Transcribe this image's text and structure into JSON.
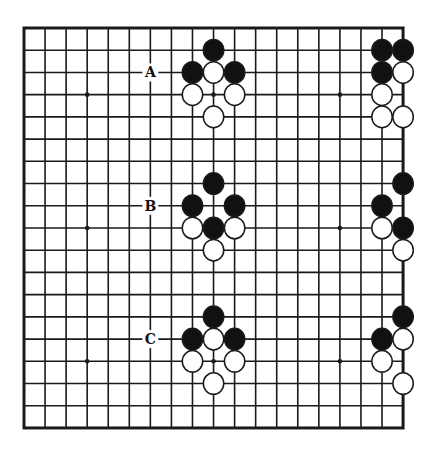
{
  "diagram": {
    "type": "go-board",
    "size": 19,
    "colors": {
      "background": "#ffffff",
      "line": "#1a1a1a",
      "black_stone": "#111111",
      "white_stone": "#ffffff",
      "stone_outline": "#1a1a1a"
    },
    "geometry": {
      "origin_x": 24,
      "origin_y": 28,
      "step_x": 21.06,
      "step_y": 22.22
    },
    "star_points": [
      [
        3,
        3
      ],
      [
        9,
        3
      ],
      [
        15,
        3
      ],
      [
        3,
        9
      ],
      [
        9,
        9
      ],
      [
        15,
        9
      ],
      [
        3,
        15
      ],
      [
        9,
        15
      ],
      [
        15,
        15
      ]
    ],
    "labels": [
      {
        "text": "A",
        "col": 6,
        "row": 2
      },
      {
        "text": "B",
        "col": 6,
        "row": 8
      },
      {
        "text": "C",
        "col": 6,
        "row": 14
      }
    ],
    "stones": [
      {
        "color": "black",
        "col": 9,
        "row": 1
      },
      {
        "color": "black",
        "col": 8,
        "row": 2
      },
      {
        "color": "white",
        "col": 9,
        "row": 2
      },
      {
        "color": "black",
        "col": 10,
        "row": 2
      },
      {
        "color": "white",
        "col": 8,
        "row": 3
      },
      {
        "color": "white",
        "col": 10,
        "row": 3
      },
      {
        "color": "white",
        "col": 9,
        "row": 4
      },
      {
        "color": "black",
        "col": 17,
        "row": 1
      },
      {
        "color": "black",
        "col": 18,
        "row": 1
      },
      {
        "color": "black",
        "col": 17,
        "row": 2
      },
      {
        "color": "white",
        "col": 18,
        "row": 2
      },
      {
        "color": "white",
        "col": 17,
        "row": 3
      },
      {
        "color": "white",
        "col": 17,
        "row": 4
      },
      {
        "color": "white",
        "col": 18,
        "row": 4
      },
      {
        "color": "black",
        "col": 9,
        "row": 7
      },
      {
        "color": "black",
        "col": 8,
        "row": 8
      },
      {
        "color": "black",
        "col": 10,
        "row": 8
      },
      {
        "color": "white",
        "col": 8,
        "row": 9
      },
      {
        "color": "black",
        "col": 9,
        "row": 9
      },
      {
        "color": "white",
        "col": 10,
        "row": 9
      },
      {
        "color": "white",
        "col": 9,
        "row": 10
      },
      {
        "color": "black",
        "col": 18,
        "row": 7
      },
      {
        "color": "black",
        "col": 17,
        "row": 8
      },
      {
        "color": "white",
        "col": 17,
        "row": 9
      },
      {
        "color": "black",
        "col": 18,
        "row": 9
      },
      {
        "color": "white",
        "col": 18,
        "row": 10
      },
      {
        "color": "black",
        "col": 9,
        "row": 13
      },
      {
        "color": "black",
        "col": 8,
        "row": 14
      },
      {
        "color": "white",
        "col": 9,
        "row": 14
      },
      {
        "color": "black",
        "col": 10,
        "row": 14
      },
      {
        "color": "white",
        "col": 8,
        "row": 15
      },
      {
        "color": "white",
        "col": 10,
        "row": 15
      },
      {
        "color": "white",
        "col": 9,
        "row": 16
      },
      {
        "color": "black",
        "col": 18,
        "row": 13
      },
      {
        "color": "black",
        "col": 17,
        "row": 14
      },
      {
        "color": "white",
        "col": 18,
        "row": 14
      },
      {
        "color": "white",
        "col": 17,
        "row": 15
      },
      {
        "color": "white",
        "col": 18,
        "row": 16
      }
    ]
  }
}
